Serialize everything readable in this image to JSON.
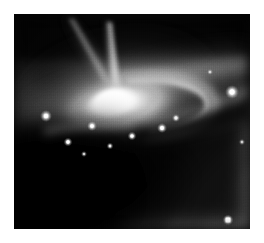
{
  "page": {
    "background_color": "#ffffff",
    "width": 264,
    "height": 243
  },
  "plate": {
    "name": "galaxy-image",
    "x": 14,
    "y": 14,
    "width": 236,
    "height": 215,
    "background_color": "#0a0a0a",
    "colorization": "grayscale",
    "caption": ""
  },
  "features": {
    "nucleus": {
      "label": "bright-galactic-nucleus",
      "cx": 104,
      "cy": 90,
      "rx": 46,
      "ry": 24,
      "rotation_deg": -14,
      "peak_color": "#ffffff"
    },
    "jet_primary": {
      "label": "polar-jet",
      "from_x": 104,
      "from_y": 82,
      "to_x": 98,
      "to_y": 6,
      "color": "#cfcfcf"
    },
    "jet_secondary": {
      "label": "secondary-streak",
      "from_x": 96,
      "from_y": 70,
      "to_x": 62,
      "to_y": 2,
      "color": "#a8a8a8"
    },
    "dust_lane": {
      "label": "dark-dust-lane",
      "color": "#050505",
      "center_x": 92,
      "center_y": 150
    },
    "ring_arc": {
      "label": "inner-ring-arc",
      "color": "#d8d8d8",
      "center_x": 120,
      "center_y": 92
    },
    "outer_arm_upper_right": {
      "label": "upper-right-spiral-arm",
      "color": "#9a9a9a"
    },
    "outer_arm_lower_right": {
      "label": "lower-right-spiral-arm",
      "color": "#b4b4b4"
    },
    "stars": [
      {
        "label": "star-knot-right",
        "x": 218,
        "y": 78,
        "r": 3.2,
        "brightness": "#ffffff"
      },
      {
        "label": "star-knot-lower-right",
        "x": 214,
        "y": 206,
        "r": 2.8,
        "brightness": "#ffffff"
      },
      {
        "label": "star-knot-left",
        "x": 32,
        "y": 102,
        "r": 2.6,
        "brightness": "#f2f2f2"
      },
      {
        "label": "star-knot-lane-a",
        "x": 78,
        "y": 112,
        "r": 2.2,
        "brightness": "#ededed"
      },
      {
        "label": "star-knot-lane-b",
        "x": 118,
        "y": 122,
        "r": 2.0,
        "brightness": "#e8e8e8"
      },
      {
        "label": "star-knot-lane-c",
        "x": 148,
        "y": 114,
        "r": 2.2,
        "brightness": "#f0f0f0"
      },
      {
        "label": "star-knot-lane-d",
        "x": 162,
        "y": 104,
        "r": 1.8,
        "brightness": "#e2e2e2"
      },
      {
        "label": "star-knot-lane-e",
        "x": 54,
        "y": 128,
        "r": 2.0,
        "brightness": "#e6e6e6"
      },
      {
        "label": "star-knot-lane-f",
        "x": 96,
        "y": 132,
        "r": 1.6,
        "brightness": "#d9d9d9"
      },
      {
        "label": "star-knot-dust",
        "x": 70,
        "y": 140,
        "r": 1.5,
        "brightness": "#cccccc"
      },
      {
        "label": "star-knot-faint-upper",
        "x": 196,
        "y": 58,
        "r": 1.4,
        "brightness": "#c4c4c4"
      },
      {
        "label": "star-knot-faint-right",
        "x": 228,
        "y": 128,
        "r": 1.5,
        "brightness": "#cfcfcf"
      }
    ]
  }
}
